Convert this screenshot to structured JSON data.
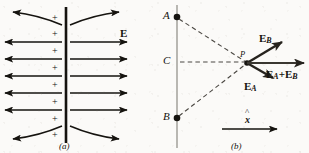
{
  "figure": {
    "title_semantic": "electric-field-of-charged-plane-and-superposition-at-point-P",
    "background_color": "#fbfaf8",
    "ink_color": "#15130f",
    "panels": [
      {
        "id": "a",
        "caption": "(a)",
        "field_label": "E",
        "charge_symbol": "+",
        "charge_count": 8,
        "field_line_count": 5,
        "curved_line_count": 2
      },
      {
        "id": "b",
        "caption": "(b)",
        "point_labels": {
          "a": "A",
          "b": "B",
          "c": "C",
          "p": "P"
        },
        "vectors": [
          {
            "name": "E_B",
            "base": "E",
            "sub": "B",
            "label": "EB"
          },
          {
            "name": "E_A",
            "base": "E",
            "sub": "A",
            "label": "EA"
          },
          {
            "name": "E_A_plus_E_B",
            "base": "E",
            "sub": "A",
            "plus": "+",
            "base2": "E",
            "sub2": "B",
            "label": "EA+EB"
          }
        ],
        "axis": {
          "hat": "^",
          "symbol": "x",
          "label": "x-hat"
        }
      }
    ]
  }
}
